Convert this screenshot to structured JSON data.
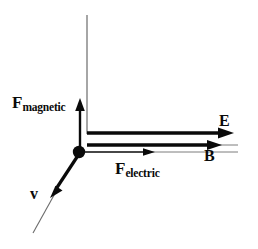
{
  "figure": {
    "background_color": "#ffffff",
    "stroke_color": "#0a0a0a",
    "axis_color": "#6b6b6b",
    "width": 258,
    "height": 249,
    "origin": {
      "x": 79,
      "y": 152,
      "dot_radius": 6
    }
  },
  "labels": {
    "f_magnetic": {
      "lead": "F",
      "sub": "magnetic"
    },
    "f_electric": {
      "lead": "F",
      "sub": "electric"
    },
    "e_field": "E",
    "b_field": "B",
    "velocity": "v"
  },
  "vectors": [
    {
      "name": "F_magnetic",
      "label": "F magnetic",
      "direction": "up",
      "from": {
        "x": 80,
        "y": 150
      },
      "to": {
        "x": 80,
        "y": 100
      },
      "stroke_width": 2.4,
      "arrowhead": true,
      "color": "#0a0a0a"
    },
    {
      "name": "E",
      "label": "E",
      "direction": "right",
      "from": {
        "x": 87,
        "y": 133
      },
      "to": {
        "x": 234,
        "y": 133
      },
      "stroke_width": 3.2,
      "arrowhead": true,
      "color": "#0a0a0a"
    },
    {
      "name": "B",
      "label": "B",
      "direction": "right",
      "from": {
        "x": 87,
        "y": 145
      },
      "to": {
        "x": 221,
        "y": 145
      },
      "stroke_width": 3.2,
      "arrowhead": true,
      "color": "#0a0a0a"
    },
    {
      "name": "F_electric",
      "label": "F electric",
      "direction": "right",
      "from": {
        "x": 81,
        "y": 152
      },
      "to": {
        "x": 154,
        "y": 152
      },
      "stroke_width": 1.1,
      "arrowhead": true,
      "color": "#0a0a0a"
    },
    {
      "name": "v",
      "label": "v",
      "direction": "down-left",
      "from": {
        "x": 79,
        "y": 154
      },
      "to": {
        "x": 51,
        "y": 197
      },
      "stroke_width": 3.0,
      "arrowhead": true,
      "color": "#0a0a0a"
    }
  ],
  "guides": [
    {
      "name": "vertical-axis",
      "from": {
        "x": 87,
        "y": 15
      },
      "to": {
        "x": 87,
        "y": 134
      },
      "stroke_width": 1.2,
      "color": "#6b6b6b"
    },
    {
      "name": "velocity-extension",
      "from": {
        "x": 56,
        "y": 190
      },
      "to": {
        "x": 33,
        "y": 233
      },
      "stroke_width": 1.0,
      "color": "#6b6b6b"
    },
    {
      "name": "b-line-extension",
      "from": {
        "x": 221,
        "y": 145
      },
      "to": {
        "x": 237,
        "y": 145
      },
      "stroke_width": 1.0,
      "color": "#6b6b6b"
    },
    {
      "name": "f-electric-extension",
      "from": {
        "x": 154,
        "y": 152
      },
      "to": {
        "x": 237,
        "y": 152
      },
      "stroke_width": 1.0,
      "color": "#6b6b6b"
    }
  ]
}
